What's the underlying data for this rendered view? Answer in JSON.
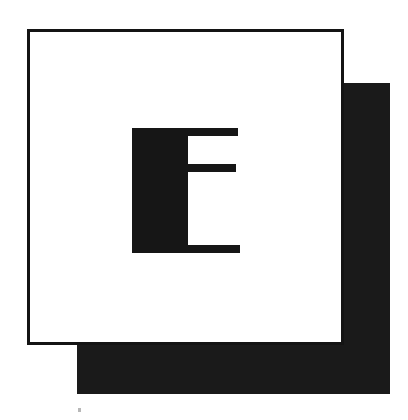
{
  "image": {
    "kind": "logo-monogram",
    "letter": "E",
    "alt_text": "E",
    "width": 408,
    "height": 420,
    "background_color": "#ffffff"
  },
  "colors": {
    "ink": "#161616",
    "frame_border": "#141414",
    "shadow": "#1a1a1a",
    "paper": "#ffffff",
    "speck": "#b8b8b8"
  },
  "shapes": {
    "shadow_square": {
      "name": "offset black square",
      "x": 77,
      "y": 83,
      "width": 313,
      "height": 311,
      "fill": "#1a1a1a"
    },
    "frame_square": {
      "name": "outlined white square",
      "x": 27,
      "y": 29,
      "width": 317,
      "height": 316,
      "fill": "#ffffff",
      "stroke": "#141414",
      "stroke_width": 3
    },
    "monogram": {
      "name": "letter E",
      "x": 132,
      "y": 128,
      "width": 106,
      "height": 125,
      "fill": "#161616",
      "parts": [
        {
          "name": "stem",
          "x": 0,
          "y": 0,
          "width": 56,
          "height": 125
        },
        {
          "name": "arm-top",
          "x": 52,
          "y": 0,
          "width": 54,
          "height": 8
        },
        {
          "name": "arm-middle",
          "x": 52,
          "y": 36,
          "width": 52,
          "height": 8
        },
        {
          "name": "arm-bottom",
          "x": 52,
          "y": 117,
          "width": 56,
          "height": 8
        }
      ]
    },
    "speck": {
      "name": "scan artifact speck",
      "x": 78,
      "y": 408,
      "width": 3,
      "height": 4,
      "fill": "#b8b8b8"
    }
  }
}
